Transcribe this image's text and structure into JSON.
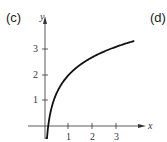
{
  "panel_labels": {
    "left": "(c)",
    "right": "(d)"
  },
  "chart_data": {
    "type": "line",
    "title": "",
    "xlabel": "x",
    "ylabel": "y",
    "x_ticks": [
      "1",
      "2",
      "3"
    ],
    "y_ticks": [
      "1",
      "2",
      "3"
    ],
    "xlim": [
      0,
      4
    ],
    "ylim": [
      -0.4,
      3.7
    ],
    "grid": false,
    "series": [
      {
        "name": "y = 2 + ln x",
        "x": [
          0.02,
          0.05,
          0.1,
          0.2,
          0.35,
          0.5,
          0.75,
          1,
          1.5,
          2,
          2.5,
          3,
          3.75
        ],
        "values": [
          -1.91,
          -1.0,
          -0.3,
          0.39,
          0.95,
          1.31,
          1.71,
          2.0,
          2.41,
          2.69,
          2.92,
          3.1,
          3.32
        ]
      }
    ]
  }
}
